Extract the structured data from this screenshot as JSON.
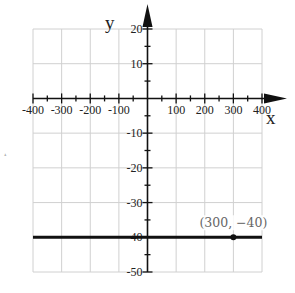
{
  "chart_data": {
    "type": "line",
    "title": "",
    "xlabel": "x",
    "ylabel": "y",
    "xlim": [
      -400,
      400
    ],
    "ylim": [
      -50,
      20
    ],
    "grid": true,
    "x_ticks": [
      -400,
      -300,
      -200,
      -100,
      100,
      200,
      300,
      400
    ],
    "x_tick_labels": [
      "-400",
      "-300",
      "-200",
      "-100",
      "100",
      "200",
      "300",
      "400"
    ],
    "y_ticks": [
      20,
      10,
      -10,
      -20,
      -30,
      -40,
      -50
    ],
    "y_tick_labels": [
      "20",
      "10",
      "-10",
      "-20",
      "-30",
      "-40",
      "-50"
    ],
    "series": [
      {
        "name": "y = -40",
        "x": [
          -400,
          400
        ],
        "y": [
          -40,
          -40
        ],
        "color": "#111111"
      }
    ],
    "points": [
      {
        "x": 300,
        "y": -40,
        "label": "(300, −40)"
      }
    ],
    "legend": null
  },
  "labels": {
    "x_axis": "x",
    "y_axis": "y",
    "point": "(300, −40)",
    "stray_mark": "˔"
  },
  "colors": {
    "grid": "#d0d0d0",
    "axis": "#111111",
    "line": "#111111",
    "point_label": "#666666"
  }
}
